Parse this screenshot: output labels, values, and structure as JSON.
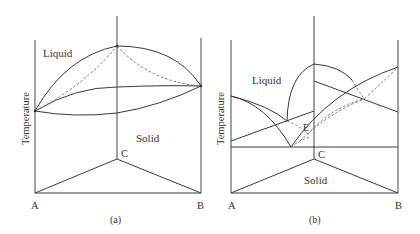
{
  "figure": {
    "panels": [
      {
        "id": "a",
        "caption": "(a)",
        "y_axis_label": "Temperature",
        "region_labels": {
          "liquid": "Liquid",
          "solid": "Solid"
        },
        "vertex_labels": {
          "left": "A",
          "right": "B",
          "apex": "C"
        },
        "description": "Ternary isomorphous system: liquidus and solidus surfaces with lens-shaped two-phase regions on each binary face"
      },
      {
        "id": "b",
        "caption": "(b)",
        "y_axis_label": "Temperature",
        "region_labels": {
          "liquid": "Liquid",
          "solid": "Solid",
          "eutectic": "E"
        },
        "vertex_labels": {
          "left": "A",
          "right": "B",
          "apex": "C"
        },
        "description": "Ternary eutectic system: liquidus surfaces meeting at ternary eutectic point E above the solid region"
      }
    ]
  },
  "colors": {
    "line": "#3a3a3a",
    "dashed": "#666666",
    "background": "#ffffff",
    "text": "#333333"
  }
}
